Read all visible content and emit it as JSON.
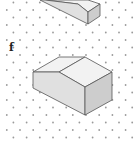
{
  "figure": {
    "labels": [
      {
        "text": "f",
        "x": 9,
        "y": 42
      }
    ],
    "colors": {
      "dot": "#9a9a9a",
      "edge": "#555555",
      "face_top": "#f2f2f2",
      "face_front": "#e0e0e0",
      "face_side": "#cdcdcd"
    },
    "dot_grid": {
      "x_spacing": 13.2,
      "y_spacing": 7.5,
      "row_offset": 6.6,
      "x0": 20,
      "y0": -5,
      "rows": 20,
      "cols": 10
    },
    "shapes": [
      {
        "name": "shape-e-partial",
        "faces": [
          {
            "type": "top",
            "points": "45,0 88,0 100,4 88,12 78,4"
          },
          {
            "type": "front",
            "points": "40,0 88,24 88,12 78,4 45,0"
          },
          {
            "type": "side",
            "points": "88,12 100,4 100,16 88,24"
          }
        ]
      },
      {
        "name": "shape-f",
        "faces": [
          {
            "type": "top",
            "points": "33,72 59,57 85,57 59,72"
          },
          {
            "type": "top",
            "points": "59,72 85,57 112,72 85,87"
          },
          {
            "type": "front",
            "points": "33,72 59,72 85,87 85,115 33,88"
          },
          {
            "type": "side",
            "points": "85,87 112,72 112,100 85,115"
          }
        ]
      }
    ]
  }
}
